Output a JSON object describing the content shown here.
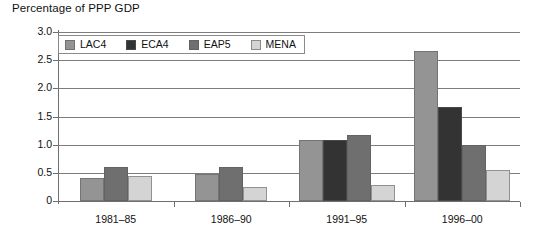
{
  "chart_data": {
    "type": "bar",
    "title": "Percentage of PPP GDP",
    "xlabel": "",
    "ylabel": "",
    "ylim": [
      0,
      3.0
    ],
    "yticks": [
      "0",
      "0.5",
      "1.0",
      "1.5",
      "2.0",
      "2.5",
      "3.0"
    ],
    "ytick_values": [
      0,
      0.5,
      1.0,
      1.5,
      2.0,
      2.5,
      3.0
    ],
    "grid": true,
    "legend_position": "top-left-inside",
    "categories": [
      "1981–85",
      "1986–90",
      "1991–95",
      "1996–00"
    ],
    "series": [
      {
        "name": "LAC4",
        "color": "#949494",
        "values": [
          0.4,
          0.48,
          1.08,
          2.67
        ]
      },
      {
        "name": "ECA4",
        "color": "#333333",
        "values": [
          null,
          null,
          1.08,
          1.67
        ]
      },
      {
        "name": "EAP5",
        "color": "#6f6f6f",
        "values": [
          0.61,
          0.6,
          1.18,
          0.99
        ]
      },
      {
        "name": "MENA",
        "color": "#d4d4d4",
        "values": [
          0.44,
          0.24,
          0.28,
          0.55
        ]
      }
    ]
  },
  "legend": {
    "items": [
      {
        "label": "LAC4",
        "color": "#949494"
      },
      {
        "label": "ECA4",
        "color": "#333333"
      },
      {
        "label": "EAP5",
        "color": "#6f6f6f"
      },
      {
        "label": "MENA",
        "color": "#d4d4d4"
      }
    ]
  }
}
